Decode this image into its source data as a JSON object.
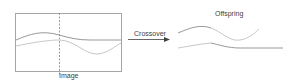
{
  "diagram": {
    "image_label": "Image",
    "crossover_label": "Crossover",
    "offspring_label": "Offspring",
    "colors": {
      "frame": "#a6a6a6",
      "divider": "#7f7f7f",
      "curve_dark": "#8c8c8c",
      "curve_light": "#c8c8c8",
      "arrow": "#404040",
      "text": "#404040"
    }
  }
}
